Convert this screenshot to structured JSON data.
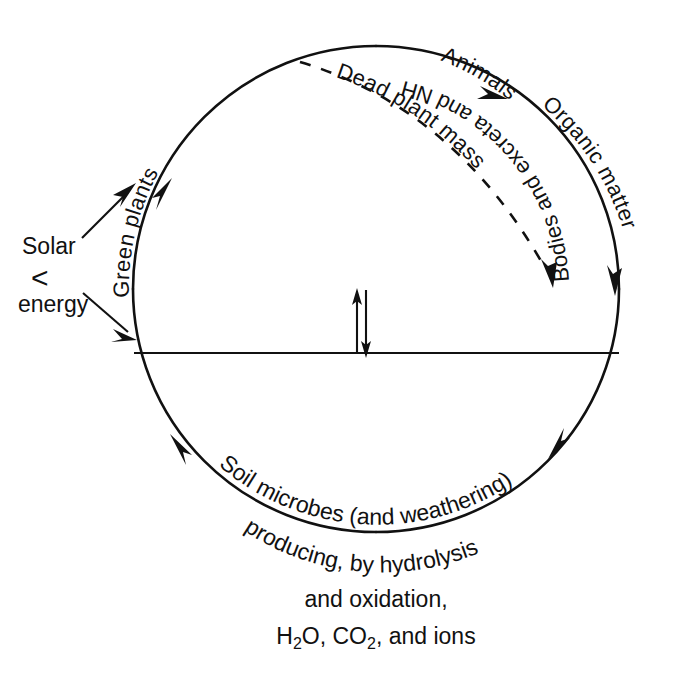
{
  "figure": {
    "background_color": "#ffffff",
    "ink_color": "#111111"
  },
  "circle": {
    "center_x": 376,
    "center_y": 289,
    "radius": 243,
    "direction": "clockwise"
  },
  "labels": {
    "solar_line1": "Solar",
    "solar_bracket": "<",
    "solar_line2": "energy",
    "green_plants": "Green plants",
    "animals": "Animals",
    "dead_plant_mass": "Dead plant mass",
    "bodies_and_excreta": "Bodies and excreta and NH",
    "bodies_sub": "4",
    "bodies_sup": "+",
    "organic_matter": "Organic matter",
    "soil_microbes": "Soil microbes (and weathering)",
    "producing": "producing, by hydrolysis",
    "and_oxidation": "and oxidation,",
    "products_h2o": "H",
    "products_h2o_sub": "2",
    "products_h2o_tail": "O, CO",
    "products_co2_sub": "2",
    "products_tail": ", and ions"
  }
}
